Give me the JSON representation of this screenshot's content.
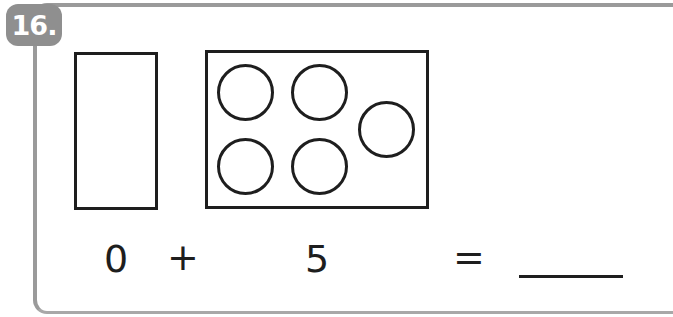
{
  "problem": {
    "number": "16.",
    "badge_color": "#8f8f8f",
    "frame_color": "#9a9a9a",
    "group_a": {
      "count": 0,
      "circles": []
    },
    "group_b": {
      "count": 5,
      "circles": [
        {
          "cx": 245,
          "cy": 92
        },
        {
          "cx": 319,
          "cy": 92
        },
        {
          "cx": 386,
          "cy": 129
        },
        {
          "cx": 245,
          "cy": 166
        },
        {
          "cx": 319,
          "cy": 166
        }
      ]
    },
    "equation": {
      "addend1": "0",
      "operator": "+",
      "addend2": "5",
      "equals": "=",
      "answer": ""
    }
  }
}
